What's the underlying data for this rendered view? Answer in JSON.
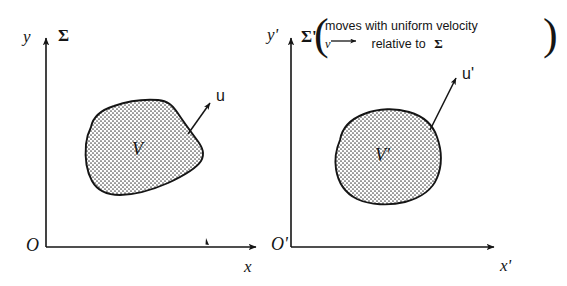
{
  "figure": {
    "background_color": "#ffffff",
    "ink_color": "#151515",
    "stipple_color": "#4a4a4a"
  },
  "panels": [
    {
      "id": "left",
      "frame_label": "Σ",
      "origin_label": "O",
      "x_axis_label": "x",
      "y_axis_label": "y",
      "region_label": "V",
      "vector_label": "u",
      "note": null
    },
    {
      "id": "right",
      "frame_label": "Σ'",
      "origin_label": "O'",
      "x_axis_label": "x'",
      "y_axis_label": "y'",
      "region_label": "V'",
      "vector_label": "u'",
      "note": {
        "line1": "moves with uniform velocity",
        "line2_vector": "v",
        "line2_rest": "relative to",
        "line2_frame": "Σ",
        "open_brace": "(",
        "close_brace": ")"
      }
    }
  ],
  "icons": {
    "arrowhead": "arrowhead-icon",
    "axis_arrow": "axis-arrow-icon",
    "tick_mark": "tick-mark-icon"
  }
}
